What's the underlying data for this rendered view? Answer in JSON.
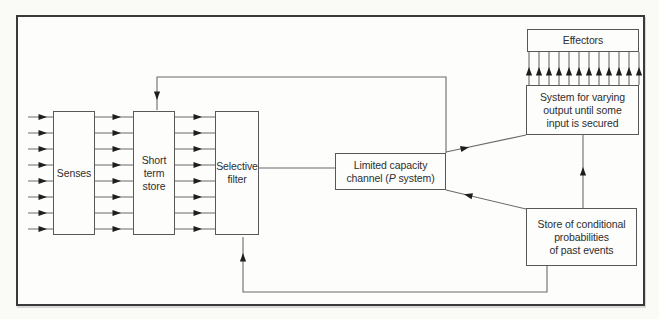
{
  "figure": {
    "boxes": {
      "senses": {
        "line1": "Senses"
      },
      "short_term_store": {
        "line1": "Short",
        "line2": "term",
        "line3": "store"
      },
      "selective_filter": {
        "line1": "Selective",
        "line2": "filter"
      },
      "limited_capacity_channel": {
        "line1": "Limited capacity",
        "line2_prefix": "channel (",
        "line2_italic": "P",
        "line2_suffix": " system)"
      },
      "effectors": {
        "line1": "Effectors"
      },
      "varying_output_system": {
        "line1": "System for varying",
        "line2": "output until some",
        "line3": "input is secured"
      },
      "conditional_store": {
        "line1": "Store of conditional",
        "line2": "probabilities",
        "line3": "of past events"
      }
    },
    "connections": [
      {
        "from": "environment-inputs",
        "to": "senses",
        "arrows": 8
      },
      {
        "from": "senses",
        "to": "short_term_store",
        "arrows": 8
      },
      {
        "from": "short_term_store",
        "to": "selective_filter",
        "arrows": 8
      },
      {
        "from": "selective_filter",
        "to": "limited_capacity_channel",
        "arrows": 0
      },
      {
        "from": "limited_capacity_channel",
        "to": "short_term_store",
        "arrows": 1,
        "note": "top feedback loop"
      },
      {
        "from": "limited_capacity_channel",
        "to": "varying_output_system",
        "arrows": 1
      },
      {
        "from": "conditional_store",
        "to": "limited_capacity_channel",
        "arrows": 1
      },
      {
        "from": "conditional_store",
        "to": "varying_output_system",
        "arrows": 1
      },
      {
        "from": "conditional_store",
        "to": "selective_filter",
        "arrows": 1,
        "note": "bottom feedback loop"
      },
      {
        "from": "varying_output_system",
        "to": "effectors",
        "arrows": 12
      }
    ],
    "colors": {
      "background": "#fafaf7",
      "frame_border": "#3a3a3a",
      "box_border": "#585858",
      "line": "#6b6b6b",
      "arrowhead": "#1e1e1e",
      "text": "#2e2e2e"
    }
  }
}
